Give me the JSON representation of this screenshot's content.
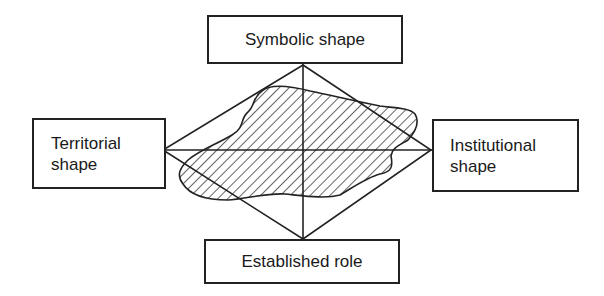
{
  "diagram": {
    "type": "rhombus-with-four-labelled-poles",
    "colors": {
      "line": "#222222",
      "text": "#1a1a1a",
      "background": "#ffffff",
      "hatch": "#222222"
    },
    "boxes": {
      "top": {
        "label": "Symbolic shape"
      },
      "left": {
        "line1": "Territorial",
        "line2": "shape"
      },
      "right": {
        "line1": "Institutional",
        "line2": "shape"
      },
      "bottom": {
        "label": "Established role"
      }
    },
    "rhombus": {
      "top": [
        303,
        65
      ],
      "right": [
        431,
        150
      ],
      "bottom": [
        303,
        239
      ],
      "left": [
        163,
        150
      ]
    },
    "blob": {
      "fill": "diagonal-hatch"
    }
  }
}
